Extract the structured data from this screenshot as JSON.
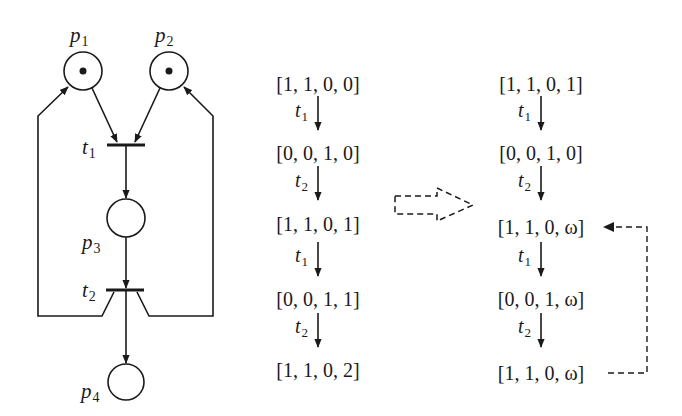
{
  "petri_net": {
    "places": [
      {
        "id": "p1",
        "label": "p",
        "sub": "1",
        "tokens": 1
      },
      {
        "id": "p2",
        "label": "p",
        "sub": "2",
        "tokens": 1
      },
      {
        "id": "p3",
        "label": "p",
        "sub": "3",
        "tokens": 0
      },
      {
        "id": "p4",
        "label": "p",
        "sub": "4",
        "tokens": 0
      }
    ],
    "transitions": [
      {
        "id": "t1",
        "label": "t",
        "sub": "1"
      },
      {
        "id": "t2",
        "label": "t",
        "sub": "2"
      }
    ]
  },
  "sequence_left": {
    "markings": [
      "[1, 1, 0, 0]",
      "[0, 0, 1, 0]",
      "[1, 1, 0, 1]",
      "[0, 0, 1, 1]",
      "[1, 1, 0, 2]"
    ],
    "steps": [
      {
        "label": "t",
        "sub": "1"
      },
      {
        "label": "t",
        "sub": "2"
      },
      {
        "label": "t",
        "sub": "1"
      },
      {
        "label": "t",
        "sub": "2"
      }
    ]
  },
  "sequence_right": {
    "markings": [
      "[1, 1, 0, 1]",
      "[0, 0, 1, 0]",
      "[1, 1, 0, ω]",
      "[0, 0, 1, ω]",
      "[1, 1, 0, ω]"
    ],
    "steps": [
      {
        "label": "t",
        "sub": "1"
      },
      {
        "label": "t",
        "sub": "2"
      },
      {
        "label": "t",
        "sub": "1"
      },
      {
        "label": "t",
        "sub": "2"
      }
    ]
  },
  "colors": {
    "ink": "#1a1a1a",
    "background": "#ffffff"
  }
}
